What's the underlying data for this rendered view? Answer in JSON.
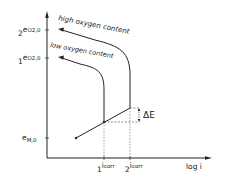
{
  "diagram": {
    "axes": {
      "x_label": "log i",
      "y_ticks": [
        {
          "prefix": "2",
          "main": "e",
          "sub": "O2,0",
          "y": 30
        },
        {
          "prefix": "1",
          "main": "e",
          "sub": "O2,0",
          "y": 58
        },
        {
          "prefix": "",
          "main": "e",
          "sub": "M,0",
          "y": 138
        }
      ],
      "x_ticks": [
        {
          "prefix": "1",
          "main": "i",
          "sub": "corr",
          "x": 104
        },
        {
          "prefix": "2",
          "main": "i",
          "sub": "corr",
          "x": 130
        }
      ]
    },
    "curves": [
      {
        "label": "high oxygen content"
      },
      {
        "label": "low oxygen content"
      }
    ],
    "annotation": {
      "delta_label": "ΔE"
    },
    "colors": {
      "line": "#222222",
      "background": "#ffffff"
    }
  }
}
